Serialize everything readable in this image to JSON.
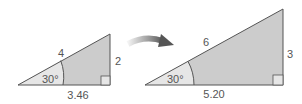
{
  "figure": {
    "colors": {
      "fill_dark": "#cccccc",
      "fill_light": "#e6e6e6",
      "stroke": "#555555",
      "text": "#555555",
      "arrow_start": "#f2f2f2",
      "arrow_end": "#555555"
    },
    "small_triangle": {
      "hypotenuse": "4",
      "opposite": "2",
      "adjacent": "3.46",
      "angle": "30°"
    },
    "arrow": {
      "meaning": "scale-up"
    },
    "large_triangle": {
      "hypotenuse": "6",
      "opposite": "3",
      "adjacent": "5.20",
      "angle": "30°"
    }
  }
}
